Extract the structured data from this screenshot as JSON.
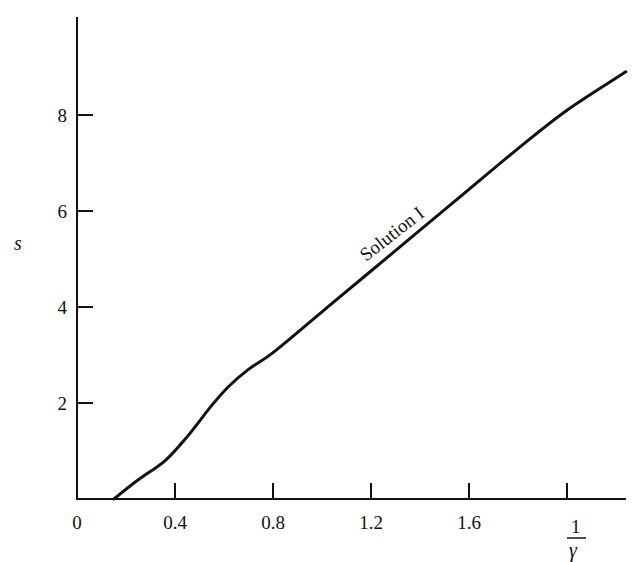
{
  "chart_data": {
    "type": "line",
    "title": "",
    "xlabel": "1/γ",
    "xlabel_parts": {
      "numerator": "1",
      "denominator": "γ"
    },
    "ylabel": "s",
    "xlim": [
      0,
      2.25
    ],
    "ylim": [
      0,
      9.0
    ],
    "x_ticks": [
      0,
      0.4,
      0.8,
      1.2,
      1.6,
      2.0
    ],
    "x_tick_labels": [
      "0",
      "0.4",
      "0.8",
      "1.2",
      "1.6",
      ""
    ],
    "y_ticks": [
      2,
      4,
      6,
      8
    ],
    "y_tick_labels": [
      "2",
      "4",
      "6",
      "8"
    ],
    "grid": false,
    "legend": null,
    "series": [
      {
        "name": "Solution I",
        "x": [
          0.15,
          0.25,
          0.36,
          0.45,
          0.55,
          0.62,
          0.7,
          0.8,
          1.0,
          1.2,
          1.4,
          1.6,
          1.8,
          2.0,
          2.24
        ],
        "values": [
          0.0,
          0.4,
          0.8,
          1.3,
          1.95,
          2.35,
          2.7,
          3.05,
          3.9,
          4.75,
          5.6,
          6.45,
          7.3,
          8.1,
          8.9
        ]
      }
    ],
    "annotations": [
      {
        "text": "Solution I",
        "x": 1.35,
        "y": 5.9,
        "rotation": -38
      }
    ]
  }
}
